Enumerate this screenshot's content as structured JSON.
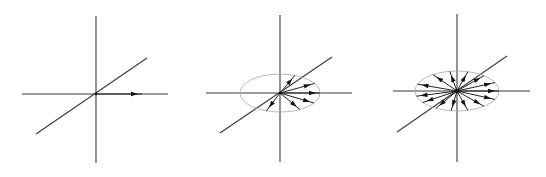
{
  "figure": {
    "colors": {
      "axis": "#3a3a3a",
      "ellipse": "#a8a8a8",
      "vector": "#222222",
      "arrowhead": "#111111",
      "background": "#ffffff"
    },
    "panels": [
      {
        "id": "panel-1",
        "center": [
          96,
          94
        ],
        "vertical_axis": [
          [
            96,
            16
          ],
          [
            96,
            163
          ]
        ],
        "horizontal_axis": [
          [
            22,
            94
          ],
          [
            168,
            94
          ]
        ],
        "diagonal_axis": [
          [
            36,
            134
          ],
          [
            147,
            58
          ]
        ],
        "ellipse": null,
        "vector_count": 1,
        "vectors_deg": [
          0
        ],
        "vector_length": 46
      },
      {
        "id": "panel-2",
        "center": [
          280,
          93
        ],
        "vertical_axis": [
          [
            280,
            15
          ],
          [
            280,
            162
          ]
        ],
        "horizontal_axis": [
          [
            206,
            93
          ],
          [
            352,
            93
          ]
        ],
        "diagonal_axis": [
          [
            220,
            133
          ],
          [
            332,
            57
          ]
        ],
        "ellipse": {
          "rx": 40,
          "ry": 19
        },
        "vector_count": 6,
        "vectors_deg": [
          0,
          30,
          68,
          300,
          328,
          250
        ],
        "vector_length": 46
      },
      {
        "id": "panel-3",
        "center": [
          457,
          91
        ],
        "vertical_axis": [
          [
            457,
            14
          ],
          [
            457,
            162
          ]
        ],
        "horizontal_axis": [
          [
            393,
            91
          ],
          [
            530,
            91
          ]
        ],
        "diagonal_axis": [
          [
            397,
            132
          ],
          [
            507,
            56
          ]
        ],
        "ellipse": {
          "rx": 42,
          "ry": 20
        },
        "vector_count": 14,
        "vectors_deg": [
          0,
          25,
          50,
          75,
          100,
          125,
          160,
          195,
          215,
          240,
          262,
          285,
          310,
          335
        ],
        "vector_length": 46
      }
    ]
  }
}
